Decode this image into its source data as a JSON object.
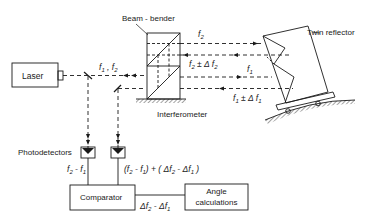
{
  "diagram": {
    "type": "optical-block-diagram",
    "components": {
      "laser": {
        "label": "Laser"
      },
      "beam_bender": {
        "label": "Beam - bender"
      },
      "twin_reflector": {
        "label": "Twin reflector"
      },
      "interferometer": {
        "label": "Interferometer"
      },
      "photodetectors": {
        "label": "Photodetectors"
      },
      "comparator": {
        "label": "Comparator"
      },
      "angle_calculations": {
        "label_line1": "Angle",
        "label_line2": "calculations"
      }
    },
    "beams": {
      "laser_output": {
        "f_a": "f",
        "sub_a": "1",
        "sep": " , ",
        "f_b": "f",
        "sub_b": "2"
      },
      "outgoing_f2": {
        "f": "f",
        "sub": "2"
      },
      "return_f2": {
        "f": "f",
        "sub": "2",
        "op": " ± Δ ",
        "f2": "f",
        "sub2": "2"
      },
      "outgoing_f1": {
        "f": "f",
        "sub": "1"
      },
      "return_f1": {
        "f": "f",
        "sub": "1",
        "op": " ± Δ ",
        "f2": "f",
        "sub2": "1"
      }
    },
    "signals": {
      "reference": {
        "a": "f",
        "a_sub": "2",
        "minus": " - ",
        "b": "f",
        "b_sub": "1"
      },
      "measurement": {
        "p1": "(",
        "a": "f",
        "a_sub": "2",
        "minus1": " - ",
        "b": "f",
        "b_sub": "1",
        "p2": ") + ( Δ",
        "c": "f",
        "c_sub": "2",
        "minus2": " - Δ",
        "d": "f",
        "d_sub": "1",
        "p3": " )"
      },
      "difference": {
        "delta1": "Δ",
        "a": "f",
        "a_sub": "2",
        "minus": " - Δ",
        "b": "f",
        "b_sub": "1"
      }
    },
    "colors": {
      "line": "#1a1a1a",
      "background": "#ffffff"
    }
  }
}
